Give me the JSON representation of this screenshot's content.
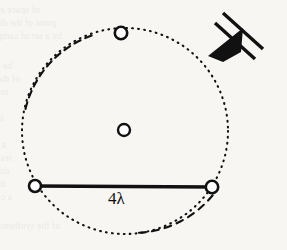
{
  "figure": {
    "canvas": {
      "width": 287,
      "height": 250
    },
    "background_color": "#f7f6f3",
    "ink_color": "#111111"
  },
  "labels": {
    "chord_dimension": "4λ"
  },
  "geometry": {
    "circle": {
      "name": "dotted-orbit-circle",
      "center_x": 125,
      "center_y": 131,
      "radius": 103,
      "stroke": "#111111",
      "stroke_width": 2.1,
      "style": "dotted"
    },
    "chord": {
      "name": "baseline-chord",
      "x1": 35,
      "y1": 186,
      "x2": 212,
      "y2": 187,
      "stroke": "#111111",
      "stroke_width": 3.4,
      "length_label": "4λ"
    },
    "markers": [
      {
        "name": "node-top",
        "x": 121,
        "y": 33,
        "r": 6.2,
        "fill": "#ffffff",
        "stroke": "#111111",
        "stroke_width": 2.6
      },
      {
        "name": "node-center",
        "x": 124,
        "y": 130,
        "r": 6.0,
        "fill": "#ffffff",
        "stroke": "#111111",
        "stroke_width": 2.4
      },
      {
        "name": "node-bottom-left",
        "x": 35,
        "y": 186,
        "r": 6.0,
        "fill": "#ffffff",
        "stroke": "#111111",
        "stroke_width": 2.6
      },
      {
        "name": "node-bottom-right",
        "x": 212,
        "y": 187,
        "r": 6.2,
        "fill": "#ffffff",
        "stroke": "#111111",
        "stroke_width": 2.6
      }
    ],
    "arrow": {
      "name": "incident-wave-arrow",
      "bar1": {
        "x1": 222,
        "y1": 14,
        "x2": 262,
        "y2": 49
      },
      "bar2": {
        "x1": 214,
        "y1": 24,
        "x2": 254,
        "y2": 59
      },
      "bar_width": 3.4,
      "head": {
        "tip_x": 209,
        "tip_y": 55,
        "points": "209,55 243,30 240,54 221,61"
      },
      "fill": "#111111",
      "direction": "down-left"
    }
  },
  "ghost_text": {
    "note": "faint show-through text from reverse page of the scan",
    "lines": [
      {
        "text": "of space exactly once. Thus, each resolvable",
        "x": 40,
        "y": 4
      },
      {
        "text": "point of the distribution can be approximated",
        "x": 56,
        "y": 17
      },
      {
        "text": "by a set of samples.",
        "x": 62,
        "y": 30
      },
      {
        "text": "be measured by a sufficient set of",
        "x": 12,
        "y": 60
      },
      {
        "text": "of the array. The element is then",
        "x": 20,
        "y": 73
      },
      {
        "text": "responses to baselines of varying lengths",
        "x": 8,
        "y": 86
      },
      {
        "text": "in the aperture plane.",
        "x": 4,
        "y": 112
      },
      {
        "text": "a fully filled aperture, the beam",
        "x": 6,
        "y": 139
      },
      {
        "text": "response of the array with the",
        "x": 12,
        "y": 152
      },
      {
        "text": "sidelobes are also found. The",
        "x": 10,
        "y": 165
      },
      {
        "text": "the response of the sampling function",
        "x": 6,
        "y": 178
      },
      {
        "text": "a correspondingly larger beamwidth",
        "x": 12,
        "y": 191
      },
      {
        "text": "of the synthesized pattern.",
        "x": 60,
        "y": 220
      }
    ]
  }
}
